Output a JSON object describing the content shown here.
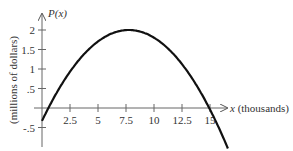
{
  "chart_data": {
    "type": "line",
    "title": "",
    "xlabel": "x (thousands)",
    "ylabel": "(millions of dollars)",
    "y_axis_title": "P(x)",
    "x_var": "x",
    "x_unit": "(thousands)",
    "x_ticks": [
      2.5,
      5,
      7.5,
      10,
      12.5,
      15
    ],
    "x_tick_labels": [
      "2.5",
      "5",
      "7.5",
      "10",
      "12.5",
      "15"
    ],
    "y_ticks": [
      2,
      1.5,
      1,
      0.5,
      -0.5
    ],
    "y_tick_labels": [
      "2",
      "1.5",
      "1",
      ".5",
      "-.5"
    ],
    "xlim": [
      0,
      16.6
    ],
    "ylim": [
      -1.0,
      2.4
    ],
    "grid": false,
    "legend": null,
    "series": [
      {
        "name": "P(x)",
        "description": "downward parabola, max ≈ 2 at x ≈ 7.75, zeros near x ≈ 0.6 and x ≈ 15",
        "x": [
          0,
          1,
          2.5,
          5,
          7.5,
          7.75,
          10,
          12.5,
          15,
          16.6
        ],
        "y": [
          -0.33,
          0.16,
          0.72,
          1.71,
          2.0,
          2.0,
          1.8,
          1.12,
          -0.05,
          -1.04
        ]
      }
    ],
    "color": "#111111"
  }
}
